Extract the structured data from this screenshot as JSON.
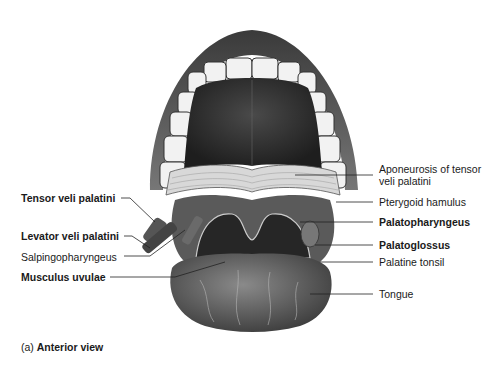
{
  "figure": {
    "caption_prefix": "(a)",
    "caption_title": "Anterior view",
    "labels_left": [
      {
        "text": "Tensor veli palatini",
        "bold": true
      },
      {
        "text": "Levator veli palatini",
        "bold": true
      },
      {
        "text": "Salpingopharyngeus",
        "bold": false
      },
      {
        "text": "Musculus uvulae",
        "bold": true
      }
    ],
    "labels_right": [
      {
        "text": "Aponeurosis of tensor",
        "bold": false
      },
      {
        "text": "veli palatini",
        "bold": false
      },
      {
        "text": "Pterygoid hamulus",
        "bold": false
      },
      {
        "text": "Palatopharyngeus",
        "bold": true
      },
      {
        "text": "Palatoglossus",
        "bold": true
      },
      {
        "text": "Palatine tonsil",
        "bold": false
      },
      {
        "text": "Tongue",
        "bold": false
      }
    ]
  }
}
